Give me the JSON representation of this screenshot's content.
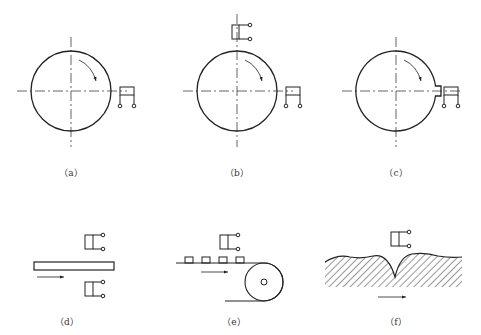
{
  "diagram": {
    "colors": {
      "stroke": "#222222",
      "background": "#ffffff"
    },
    "panels": [
      {
        "id": "a",
        "label": "（a）",
        "description": "Rotating disk with sensor at right edge"
      },
      {
        "id": "b",
        "label": "（b）",
        "description": "Rotating disk with sensors at top and right"
      },
      {
        "id": "c",
        "label": "（c）",
        "description": "Rotating disk with notch, sensor at right"
      },
      {
        "id": "d",
        "label": "（d）",
        "description": "Moving strip between two sensors"
      },
      {
        "id": "e",
        "label": "（e）",
        "description": "Conveyor belt with parts passing under sensor"
      },
      {
        "id": "f",
        "label": "（f）",
        "description": "Moving rough surface under sensor"
      }
    ]
  }
}
